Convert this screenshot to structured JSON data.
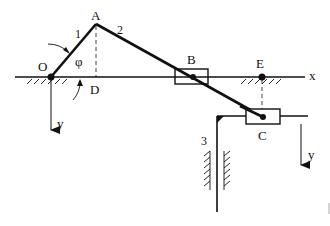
{
  "diagram": {
    "type": "mechanism-kinematic-scheme",
    "points": {
      "O": {
        "label": "O",
        "x": 51,
        "y": 77
      },
      "A": {
        "label": "A",
        "x": 96,
        "y": 24
      },
      "B": {
        "label": "B",
        "x": 193,
        "y": 77
      },
      "C": {
        "label": "C",
        "x": 263,
        "y": 117
      },
      "D": {
        "label": "D",
        "x": 96,
        "y": 77
      },
      "E": {
        "label": "E",
        "x": 262,
        "y": 77
      }
    },
    "links": [
      {
        "id": "1",
        "label": "1",
        "from": "O",
        "to": "A"
      },
      {
        "id": "2",
        "label": "2",
        "from": "A",
        "to": "C"
      },
      {
        "id": "3",
        "label": "3",
        "description": "vertical slider rod with guide"
      }
    ],
    "angle_label": "φ",
    "axes": {
      "x_label": "x",
      "y_label_left": "y",
      "y_label_right": "y"
    },
    "colors": {
      "ink": "#111111",
      "background": "#ffffff"
    }
  }
}
